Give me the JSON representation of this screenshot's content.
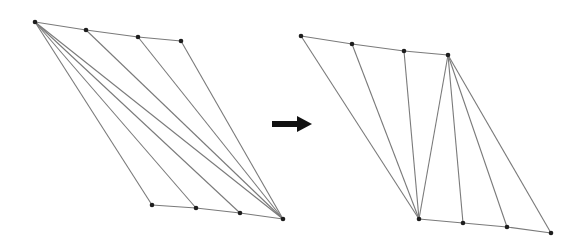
{
  "diagram": {
    "type": "triangulation-flip",
    "colors": {
      "edge": "#7a7a7a",
      "vertex": "#1e1e1e",
      "arrow": "#111111",
      "background": "#ffffff"
    },
    "before": {
      "vertices": {
        "A": [
          35,
          22
        ],
        "B": [
          86,
          30
        ],
        "C": [
          138,
          37
        ],
        "D": [
          181,
          41
        ],
        "E": [
          152,
          205
        ],
        "F": [
          196,
          208
        ],
        "G": [
          240,
          213
        ],
        "H": [
          283,
          219
        ]
      },
      "boundary_edges": [
        [
          "A",
          "B"
        ],
        [
          "B",
          "C"
        ],
        [
          "C",
          "D"
        ],
        [
          "E",
          "F"
        ],
        [
          "F",
          "G"
        ],
        [
          "G",
          "H"
        ],
        [
          "A",
          "E"
        ],
        [
          "D",
          "H"
        ]
      ],
      "diagonals": [
        [
          "A",
          "F"
        ],
        [
          "A",
          "G"
        ],
        [
          "A",
          "H"
        ],
        [
          "B",
          "H"
        ],
        [
          "C",
          "H"
        ]
      ]
    },
    "arrow": {
      "from": [
        272,
        124
      ],
      "to": [
        312,
        124
      ],
      "direction": "right"
    },
    "after": {
      "vertices": {
        "P1": [
          301,
          36
        ],
        "P2": [
          352,
          44
        ],
        "P3": [
          404,
          51
        ],
        "P4": [
          448,
          55
        ],
        "Q1": [
          419,
          219
        ],
        "Q2": [
          463,
          223
        ],
        "Q3": [
          507,
          227
        ],
        "Q4": [
          551,
          233
        ]
      },
      "boundary_edges": [
        [
          "P1",
          "P2"
        ],
        [
          "P2",
          "P3"
        ],
        [
          "P3",
          "P4"
        ],
        [
          "Q1",
          "Q2"
        ],
        [
          "Q2",
          "Q3"
        ],
        [
          "Q3",
          "Q4"
        ],
        [
          "P1",
          "Q1"
        ],
        [
          "P4",
          "Q4"
        ]
      ],
      "diagonals": [
        [
          "P2",
          "Q1"
        ],
        [
          "P3",
          "Q1"
        ],
        [
          "P4",
          "Q1"
        ],
        [
          "P4",
          "Q2"
        ],
        [
          "P4",
          "Q3"
        ]
      ]
    }
  }
}
